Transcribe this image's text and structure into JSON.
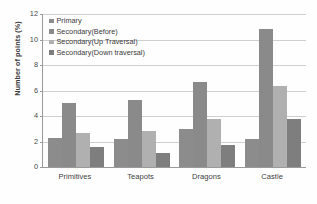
{
  "chart_data": {
    "type": "bar",
    "title": "",
    "xlabel": "",
    "ylabel": "Number of points (%)",
    "ylim": [
      0,
      12
    ],
    "yticks": [
      0,
      2,
      4,
      6,
      8,
      10,
      12
    ],
    "grid": true,
    "legend_position": "top-left",
    "categories": [
      "Primitives",
      "Teapots",
      "Dragons",
      "Castle"
    ],
    "series": [
      {
        "name": "Primary",
        "color": "#8c8c8c",
        "values": [
          2.3,
          2.2,
          3.0,
          2.2
        ]
      },
      {
        "name": "Secondary(Before)",
        "color": "#8a8a8a",
        "values": [
          5.05,
          5.25,
          6.7,
          10.85
        ]
      },
      {
        "name": "Secondary(Up Traversal)",
        "color": "#b0b0b0",
        "values": [
          2.65,
          2.85,
          3.8,
          6.35
        ]
      },
      {
        "name": "Secondary(Down traversal)",
        "color": "#7e7e7e",
        "values": [
          1.6,
          1.1,
          1.7,
          3.8
        ]
      }
    ]
  },
  "axis": {
    "y_title": "Number of points (%)",
    "tick_labels": [
      "12",
      "10",
      "8",
      "6",
      "4",
      "2",
      "0"
    ]
  },
  "colors": {
    "gridline": "#cfcfcf",
    "axis": "#9a9a9a",
    "text": "#3b3b3b",
    "background": "#ffffff"
  }
}
